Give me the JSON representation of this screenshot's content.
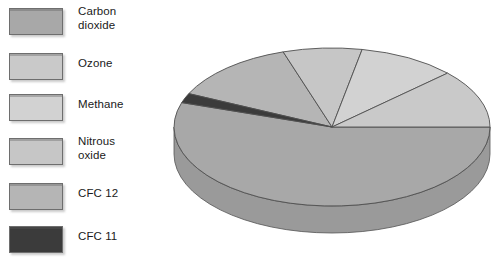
{
  "figure": {
    "background_color": "#ffffff"
  },
  "legend": {
    "name": "gas-legend",
    "position": "left",
    "items": [
      {
        "label": "Carbon\ndioxide",
        "color": "#a8a8a8",
        "y": 8
      },
      {
        "label": "Ozone",
        "color": "#c9c9c9",
        "y": 53
      },
      {
        "label": "Methane",
        "color": "#d2d2d2",
        "y": 94
      },
      {
        "label": "Nitrous\noxide",
        "color": "#c6c6c6",
        "y": 138
      },
      {
        "label": "CFC 12",
        "color": "#b5b5b5",
        "y": 183
      },
      {
        "label": "CFC 11",
        "color": "#3b3b3b",
        "y": 226
      }
    ]
  },
  "chart_data": {
    "type": "pie",
    "title": "",
    "subtitle": "",
    "xlabel": "",
    "ylabel": "",
    "three_d": true,
    "depth_px": 27,
    "legend_position": "left",
    "grid": false,
    "labels": [
      "Carbon dioxide",
      "Ozone",
      "Methane",
      "Nitrous oxide",
      "CFC 12",
      "CFC 11"
    ],
    "values": [
      55,
      12,
      10,
      8,
      13,
      2
    ],
    "units": "percent",
    "colors": [
      "#a8a8a8",
      "#c9c9c9",
      "#d2d2d2",
      "#c6c6c6",
      "#b5b5b5",
      "#3b3b3b"
    ],
    "side_colors": [
      "#9a9a9a",
      "#bdbdbd",
      "#c4c4c4",
      "#b8b8b8",
      "#a8a8a8",
      "#2a2a2a"
    ],
    "start_angle_deg": 0,
    "direction": "clockwise",
    "geometry": {
      "center_x": 172,
      "center_y": 127,
      "radius_x": 158,
      "radius_y": 79
    },
    "slices": [
      {
        "label": "Carbon dioxide",
        "value": 55,
        "start_deg": 0,
        "end_deg": 198,
        "color": "#a8a8a8"
      },
      {
        "label": "CFC 11",
        "value": 2,
        "start_deg": 198,
        "end_deg": 205,
        "color": "#3b3b3b"
      },
      {
        "label": "CFC 12",
        "value": 13,
        "start_deg": 205,
        "end_deg": 252,
        "color": "#b5b5b5"
      },
      {
        "label": "Nitrous oxide",
        "value": 8,
        "start_deg": 252,
        "end_deg": 281,
        "color": "#c6c6c6"
      },
      {
        "label": "Methane",
        "value": 10,
        "start_deg": 281,
        "end_deg": 317,
        "color": "#d2d2d2"
      },
      {
        "label": "Ozone",
        "value": 12,
        "start_deg": 317,
        "end_deg": 360,
        "color": "#c9c9c9"
      }
    ]
  }
}
